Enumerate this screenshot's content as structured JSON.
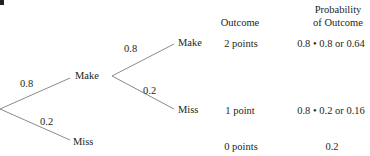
{
  "figure_label_fragment": "b",
  "headers": {
    "outcome": "Outcome",
    "probability_line1": "Probability",
    "probability_line2": "of Outcome"
  },
  "tree": {
    "first_shot": {
      "make": {
        "label": "Make",
        "probability": "0.8"
      },
      "miss": {
        "label": "Miss",
        "probability": "0.2"
      }
    },
    "second_shot": {
      "make": {
        "label": "Make",
        "probability": "0.8"
      },
      "miss": {
        "label": "Miss",
        "probability": "0.2"
      }
    }
  },
  "outcomes": [
    {
      "outcome": "2 points",
      "probability": "0.8 • 0.8 or 0.64"
    },
    {
      "outcome": "1 point",
      "probability": "0.8 • 0.2 or 0.16"
    },
    {
      "outcome": "0 points",
      "probability": "0.2"
    }
  ],
  "colors": {
    "lines": "#8a8a8a",
    "text": "#231f20"
  }
}
